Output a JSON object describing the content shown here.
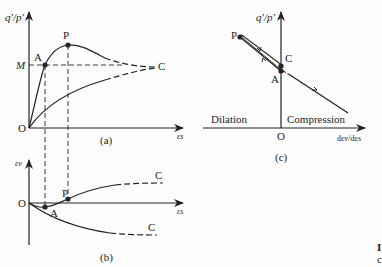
{
  "panel_a": {
    "caption": "(a)",
    "y_axis_label": "q′/p′",
    "x_axis_label": "εs",
    "origin": "O",
    "points": {
      "A": "A",
      "P": "P",
      "C": "C",
      "M": "M"
    }
  },
  "panel_b": {
    "caption": "(b)",
    "y_axis_label": "εv",
    "x_axis_label": "εs",
    "origin": "O",
    "points": {
      "A": "A",
      "P": "P",
      "C_upper": "C",
      "C_lower": "C"
    }
  },
  "panel_c": {
    "caption": "(c)",
    "y_axis_label": "q′/p′",
    "x_axis_label": "dεv/dεs",
    "origin": "O",
    "points": {
      "P": "P",
      "C": "C",
      "A": "A"
    },
    "regions": {
      "left": "Dilation",
      "right": "Compression"
    }
  },
  "edge_text": {
    "top": "I",
    "bottom": "c"
  },
  "colors": {
    "ink": "#222222",
    "background": "#fdfdfd"
  }
}
